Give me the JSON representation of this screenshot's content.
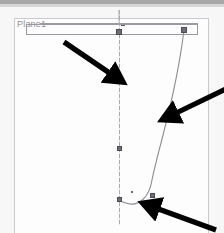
{
  "app": {
    "type": "cad-sketch-viewport",
    "plane_label": "Plane1"
  },
  "colors": {
    "viewport_background": "#fdfdfd",
    "page_background": "#f7f7f7",
    "toolbar_band": "#a8a8a8",
    "geometry_line": "#8a8a94",
    "centerline": "#a9a9b4",
    "handle_fill": "#6e6e78",
    "handle_border": "#4a4a52",
    "annotation_arrow": "#000000",
    "label_text": "#8e8e96"
  },
  "viewport": {
    "x": 14,
    "y": 18,
    "width": 195,
    "height": 215
  },
  "geometry": {
    "centerline": {
      "x": 119,
      "top": 10,
      "bottom": 225
    },
    "construction_rectangle": {
      "x": 26,
      "y": 24,
      "width": 172,
      "height": 11
    },
    "spline_path": "M 184 30 C 176 95, 158 150, 152 180 C 149 199, 138 205, 130 204 C 123 203, 119 200, 119 200",
    "handles": [
      {
        "name": "handle-top-center",
        "x": 116,
        "y": 29
      },
      {
        "name": "handle-top-right",
        "x": 181,
        "y": 27
      },
      {
        "name": "handle-mid-centerline",
        "x": 117,
        "y": 146
      },
      {
        "name": "handle-bottom-left",
        "x": 117,
        "y": 197
      },
      {
        "name": "handle-bottom-right",
        "x": 150,
        "y": 193
      }
    ],
    "points": [
      {
        "name": "sketch-point-lower",
        "x": 131,
        "y": 191
      }
    ]
  },
  "annotations": {
    "arrows": [
      {
        "name": "annotation-arrow-centerline",
        "from": [
          64,
          42
        ],
        "to": [
          118,
          79
        ],
        "target": "vertical centerline"
      },
      {
        "name": "annotation-arrow-spline",
        "from": [
          226,
          89
        ],
        "to": [
          166,
          118
        ],
        "target": "spline curve"
      },
      {
        "name": "annotation-arrow-tangent",
        "from": [
          214,
          229
        ],
        "to": [
          147,
          205
        ],
        "target": "curve tangent at bottom"
      }
    ]
  }
}
